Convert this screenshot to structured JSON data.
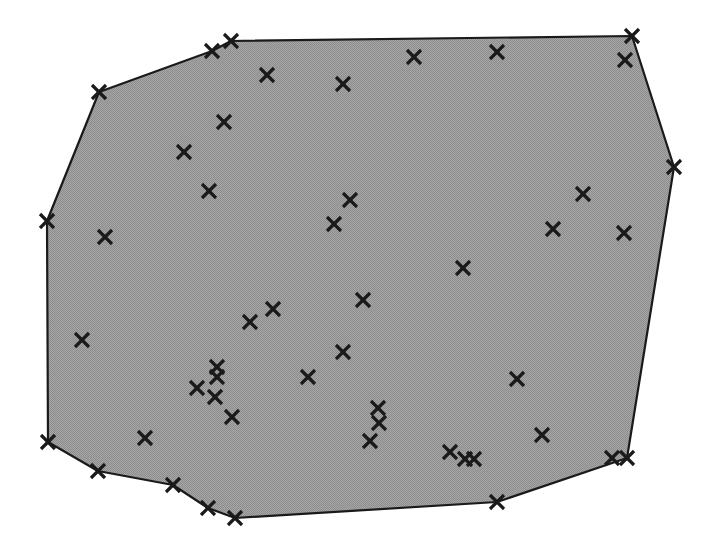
{
  "figure": {
    "title": "",
    "background_color": "#ffffff",
    "width": 717,
    "height": 554
  },
  "chart_data": {
    "type": "scatter",
    "title": "",
    "subtitle": "",
    "xlabel": "",
    "ylabel": "",
    "xlim": [
      0,
      717
    ],
    "ylim": [
      0,
      554
    ],
    "grid": false,
    "legend": null,
    "axes_visible": false,
    "tick_labels": {
      "x": [],
      "y": []
    },
    "annotations": [],
    "marker_style": {
      "symbol": "x",
      "color": "#1a1a1a",
      "size": 14,
      "stroke_width": 3.2
    },
    "hull": {
      "name": "convex-hull",
      "fill_color": "#9a9a9a",
      "fill_pattern": "dither-gray",
      "edge_color": "#1a1a1a",
      "edge_width": 2.2,
      "vertices": [
        [
          231,
          41
        ],
        [
          632,
          36
        ],
        [
          674,
          167
        ],
        [
          627,
          458
        ],
        [
          497,
          502
        ],
        [
          235,
          518
        ],
        [
          208,
          508
        ],
        [
          173,
          485
        ],
        [
          98,
          471
        ],
        [
          48,
          442
        ],
        [
          47,
          221
        ],
        [
          99,
          92
        ],
        [
          212,
          51
        ]
      ]
    },
    "series": [
      {
        "name": "points",
        "points": [
          [
            231,
            41
          ],
          [
            212,
            51
          ],
          [
            99,
            92
          ],
          [
            47,
            221
          ],
          [
            48,
            442
          ],
          [
            98,
            471
          ],
          [
            173,
            485
          ],
          [
            208,
            508
          ],
          [
            235,
            518
          ],
          [
            497,
            502
          ],
          [
            612,
            458
          ],
          [
            627,
            458
          ],
          [
            674,
            167
          ],
          [
            632,
            36
          ],
          [
            267,
            75
          ],
          [
            343,
            84
          ],
          [
            414,
            57
          ],
          [
            497,
            52
          ],
          [
            625,
            60
          ],
          [
            224,
            122
          ],
          [
            184,
            152
          ],
          [
            209,
            191
          ],
          [
            350,
            200
          ],
          [
            334,
            224
          ],
          [
            583,
            194
          ],
          [
            105,
            237
          ],
          [
            553,
            229
          ],
          [
            624,
            233
          ],
          [
            463,
            268
          ],
          [
            363,
            300
          ],
          [
            273,
            309
          ],
          [
            250,
            322
          ],
          [
            82,
            340
          ],
          [
            343,
            352
          ],
          [
            308,
            377
          ],
          [
            517,
            379
          ],
          [
            217,
            367
          ],
          [
            217,
            377
          ],
          [
            197,
            388
          ],
          [
            215,
            397
          ],
          [
            232,
            417
          ],
          [
            378,
            408
          ],
          [
            379,
            423
          ],
          [
            370,
            441
          ],
          [
            145,
            438
          ],
          [
            542,
            435
          ],
          [
            450,
            452
          ],
          [
            465,
            459
          ],
          [
            474,
            459
          ]
        ],
        "count": 49
      }
    ]
  }
}
